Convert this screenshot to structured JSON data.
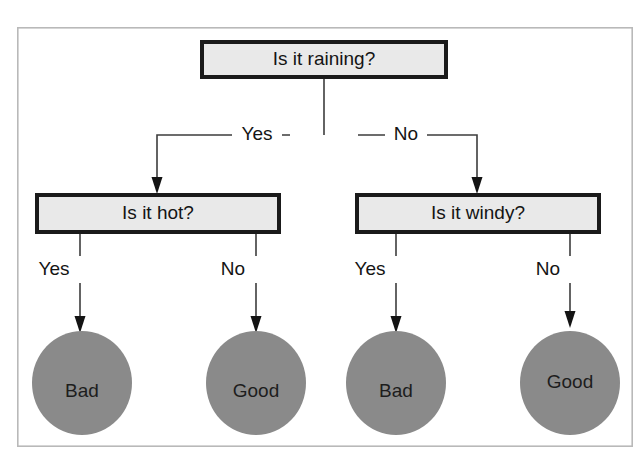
{
  "diagram": {
    "frame": {
      "x": 17,
      "y": 27,
      "width": 616,
      "height": 420
    },
    "colors": {
      "box_fill": "#e9e9e9",
      "box_border": "#1a1a1a",
      "leaf_fill": "#8a8a8a",
      "text": "#141414",
      "connector": "#3d3d3d",
      "frame_border": "#b9b9b9",
      "background": "#ffffff"
    },
    "decision_nodes": [
      {
        "id": "root",
        "label": "Is it raining?",
        "x": 200,
        "y": 40,
        "width": 248,
        "height": 39,
        "cx": 324,
        "cy": 59
      },
      {
        "id": "hot",
        "label": "Is it hot?",
        "x": 35,
        "y": 193,
        "width": 246,
        "height": 41,
        "cx": 158,
        "cy": 213
      },
      {
        "id": "windy",
        "label": "Is it windy?",
        "x": 355,
        "y": 193,
        "width": 246,
        "height": 41,
        "cx": 478,
        "cy": 213
      }
    ],
    "leaf_nodes": [
      {
        "id": "leaf-1",
        "label": "Bad",
        "cx": 82,
        "cy": 383,
        "rx": 50,
        "ry": 52
      },
      {
        "id": "leaf-2",
        "label": "Good",
        "cx": 256,
        "cy": 383,
        "rx": 50,
        "ry": 52
      },
      {
        "id": "leaf-3",
        "label": "Bad",
        "cx": 396,
        "cy": 383,
        "rx": 50,
        "ry": 52
      },
      {
        "id": "leaf-4",
        "label": "Good",
        "cx": 570,
        "cy": 383,
        "rx": 50,
        "ry": 52
      }
    ],
    "edges": [
      {
        "id": "root-yes",
        "label": "Yes",
        "from": "root",
        "to": "hot",
        "label_x": 257,
        "label_y": 134
      },
      {
        "id": "root-no",
        "label": "No",
        "from": "root",
        "to": "windy",
        "label_x": 406,
        "label_y": 134
      },
      {
        "id": "hot-yes",
        "label": "Yes",
        "from": "hot",
        "to": "leaf-1",
        "label_x": 54,
        "label_y": 270
      },
      {
        "id": "hot-no",
        "label": "No",
        "from": "hot",
        "to": "leaf-2",
        "label_x": 233,
        "label_y": 270
      },
      {
        "id": "windy-yes",
        "label": "Yes",
        "from": "windy",
        "to": "leaf-3",
        "label_x": 370,
        "label_y": 270
      },
      {
        "id": "windy-no",
        "label": "No",
        "from": "windy",
        "to": "leaf-4",
        "label_x": 548,
        "label_y": 270
      }
    ]
  }
}
